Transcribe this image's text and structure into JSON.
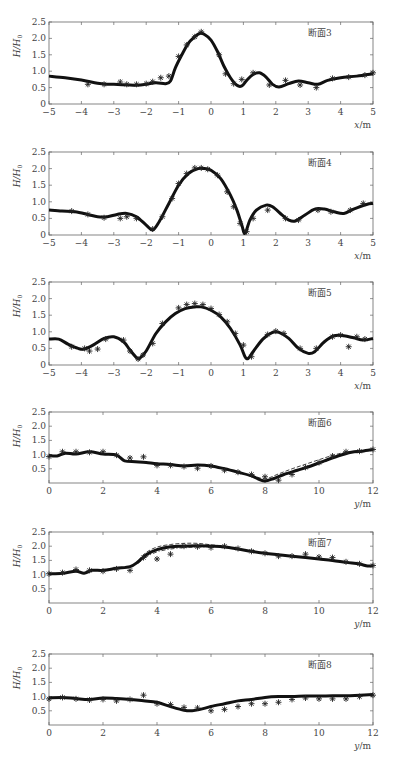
{
  "figure": {
    "ylabel": "H/H0",
    "panels_count": 6
  },
  "chart_data": [
    {
      "type": "line",
      "title": "断面3",
      "xlabel": "x/m",
      "ylabel": "H/H0",
      "xlim": [
        -5,
        5
      ],
      "ylim": [
        0,
        2.5
      ],
      "xticks": [
        -5,
        -4,
        -3,
        -2,
        -1,
        0,
        1,
        2,
        3,
        4,
        5
      ],
      "yticks": [
        0,
        0.5,
        1.0,
        1.5,
        2.0,
        2.5
      ],
      "ytick_labels": [
        "0",
        "0.5",
        "1.0",
        "1.5",
        "2.0",
        "2.5"
      ],
      "grid": false,
      "frame": {
        "top": 22,
        "bottom": 104
      },
      "series": [
        {
          "name": "computed",
          "style": "solid-thick",
          "x": [
            -5,
            -4.5,
            -4,
            -3.5,
            -3.2,
            -3,
            -2.5,
            -2.3,
            -2,
            -1.7,
            -1.4,
            -1.25,
            -1.1,
            -0.9,
            -0.7,
            -0.5,
            -0.35,
            -0.2,
            0,
            0.2,
            0.4,
            0.6,
            0.8,
            0.95,
            1.1,
            1.3,
            1.5,
            1.7,
            1.9,
            2.1,
            2.4,
            2.7,
            3.0,
            3.3,
            3.6,
            4.0,
            4.5,
            5.0
          ],
          "y": [
            0.85,
            0.8,
            0.73,
            0.63,
            0.6,
            0.6,
            0.58,
            0.57,
            0.6,
            0.65,
            0.62,
            0.7,
            1.1,
            1.5,
            1.85,
            2.05,
            2.15,
            2.12,
            1.95,
            1.6,
            1.15,
            0.8,
            0.57,
            0.55,
            0.72,
            0.9,
            0.95,
            0.82,
            0.6,
            0.52,
            0.62,
            0.7,
            0.65,
            0.6,
            0.72,
            0.8,
            0.85,
            0.92
          ]
        },
        {
          "name": "measured",
          "style": "asterisk",
          "x": [
            -3.8,
            -3.3,
            -2.8,
            -2.6,
            -2.3,
            -2.0,
            -1.8,
            -1.55,
            -1.3,
            -1.0,
            -0.75,
            -0.5,
            -0.3,
            0.25,
            0.45,
            0.7,
            0.95,
            1.3,
            1.8,
            2.3,
            2.75,
            3.25,
            3.75,
            4.25,
            4.75,
            5.0
          ],
          "y": [
            0.6,
            0.6,
            0.67,
            0.6,
            0.6,
            0.62,
            0.68,
            0.8,
            0.85,
            1.45,
            1.8,
            2.05,
            2.2,
            1.5,
            0.92,
            0.62,
            0.75,
            0.95,
            0.58,
            0.72,
            0.58,
            0.5,
            0.78,
            0.82,
            0.88,
            0.95
          ]
        }
      ]
    },
    {
      "type": "line",
      "title": "断面4",
      "xlabel": "x/m",
      "ylabel": "H/H0",
      "xlim": [
        -5,
        5
      ],
      "ylim": [
        0,
        2.5
      ],
      "xticks": [
        -5,
        -4,
        -3,
        -2,
        -1,
        0,
        1,
        2,
        3,
        4,
        5
      ],
      "yticks": [
        0,
        0.5,
        1.0,
        1.5,
        2.0,
        2.5
      ],
      "ytick_labels": [
        "0",
        "0.5",
        "1.0",
        "1.5",
        "2.0",
        "2.5"
      ],
      "grid": false,
      "frame": {
        "top": 152,
        "bottom": 235
      },
      "series": [
        {
          "name": "computed",
          "style": "solid-thick",
          "x": [
            -5,
            -4.6,
            -4.2,
            -3.8,
            -3.5,
            -3.2,
            -2.9,
            -2.6,
            -2.3,
            -2.0,
            -1.8,
            -1.6,
            -1.3,
            -1.0,
            -0.7,
            -0.4,
            -0.2,
            0,
            0.3,
            0.6,
            0.8,
            0.95,
            1.05,
            1.2,
            1.4,
            1.7,
            1.9,
            2.2,
            2.4,
            2.6,
            2.9,
            3.2,
            3.5,
            3.8,
            4.1,
            4.4,
            4.8,
            5.0
          ],
          "y": [
            0.75,
            0.72,
            0.7,
            0.62,
            0.55,
            0.55,
            0.62,
            0.65,
            0.55,
            0.3,
            0.15,
            0.4,
            0.95,
            1.5,
            1.85,
            2.0,
            2.0,
            1.95,
            1.7,
            1.2,
            0.75,
            0.3,
            0.05,
            0.45,
            0.75,
            0.9,
            0.85,
            0.6,
            0.45,
            0.42,
            0.6,
            0.78,
            0.78,
            0.7,
            0.65,
            0.78,
            0.92,
            0.95
          ]
        },
        {
          "name": "measured",
          "style": "asterisk",
          "x": [
            -4.3,
            -3.8,
            -3.3,
            -2.8,
            -2.6,
            -2.3,
            -1.8,
            -1.5,
            -1.2,
            -1.0,
            -0.75,
            -0.5,
            -0.3,
            -0.1,
            0.2,
            0.5,
            0.7,
            0.9,
            1.1,
            1.3,
            1.75,
            2.3,
            2.7,
            3.3,
            3.7,
            4.3,
            4.7
          ],
          "y": [
            0.72,
            0.62,
            0.52,
            0.5,
            0.55,
            0.5,
            0.18,
            0.55,
            1.1,
            1.55,
            1.85,
            2.02,
            2.02,
            1.98,
            1.8,
            1.3,
            0.85,
            0.35,
            0.1,
            0.5,
            0.75,
            0.5,
            0.45,
            0.75,
            0.7,
            0.75,
            0.95
          ]
        }
      ]
    },
    {
      "type": "line",
      "title": "断面5",
      "xlabel": "x/m",
      "ylabel": "H/H0",
      "xlim": [
        -5,
        5
      ],
      "ylim": [
        0,
        2.5
      ],
      "xticks": [
        -5,
        -4,
        -3,
        -2,
        -1,
        0,
        1,
        2,
        3,
        4,
        5
      ],
      "yticks": [
        0,
        0.5,
        1.0,
        1.5,
        2.0,
        2.5
      ],
      "ytick_labels": [
        "0",
        "0.5",
        "1.0",
        "1.5",
        "2.0",
        "2.5"
      ],
      "grid": false,
      "frame": {
        "top": 282,
        "bottom": 365
      },
      "series": [
        {
          "name": "computed",
          "style": "solid-thick",
          "x": [
            -5,
            -4.7,
            -4.4,
            -4.1,
            -3.9,
            -3.6,
            -3.3,
            -3.0,
            -2.7,
            -2.5,
            -2.3,
            -2.2,
            -2.0,
            -1.7,
            -1.4,
            -1.1,
            -0.8,
            -0.5,
            -0.3,
            0,
            0.3,
            0.6,
            0.9,
            1.05,
            1.15,
            1.3,
            1.6,
            1.9,
            2.1,
            2.4,
            2.7,
            3.0,
            3.2,
            3.5,
            3.8,
            4.1,
            4.4,
            4.7,
            5.0
          ],
          "y": [
            0.78,
            0.78,
            0.62,
            0.5,
            0.48,
            0.62,
            0.8,
            0.85,
            0.7,
            0.45,
            0.22,
            0.2,
            0.42,
            0.95,
            1.3,
            1.55,
            1.7,
            1.75,
            1.75,
            1.65,
            1.45,
            1.1,
            0.6,
            0.25,
            0.2,
            0.4,
            0.78,
            0.98,
            0.98,
            0.8,
            0.5,
            0.35,
            0.4,
            0.7,
            0.88,
            0.88,
            0.82,
            0.75,
            0.8
          ]
        },
        {
          "name": "measured",
          "style": "asterisk",
          "x": [
            -4.3,
            -3.9,
            -3.75,
            -3.5,
            -3.25,
            -2.7,
            -2.5,
            -2.25,
            -2.1,
            -1.8,
            -1.5,
            -1.0,
            -0.75,
            -0.5,
            -0.25,
            0,
            0.25,
            0.5,
            0.75,
            1.0,
            1.25,
            1.75,
            2.0,
            2.25,
            2.75,
            3.25,
            3.75,
            4.0,
            4.25,
            4.5,
            4.75
          ],
          "y": [
            0.55,
            0.5,
            0.42,
            0.48,
            0.78,
            0.75,
            0.42,
            0.18,
            0.3,
            0.65,
            1.25,
            1.72,
            1.82,
            1.85,
            1.82,
            1.7,
            1.52,
            1.3,
            0.95,
            0.6,
            0.25,
            0.92,
            1.02,
            0.95,
            0.5,
            0.5,
            0.85,
            0.9,
            0.55,
            0.85,
            0.78
          ]
        }
      ]
    },
    {
      "type": "line",
      "title": "断面6",
      "xlabel": "y/m",
      "ylabel": "H/H0",
      "xlim": [
        0,
        12
      ],
      "ylim": [
        0,
        2.5
      ],
      "xticks": [
        0,
        2,
        4,
        6,
        8,
        10,
        12
      ],
      "yticks": [
        0.5,
        1.0,
        1.5,
        2.0,
        2.5
      ],
      "ytick_labels": [
        "0.5",
        "1.0",
        "1.5",
        "2.0",
        "2.5"
      ],
      "grid": false,
      "frame": {
        "top": 412,
        "bottom": 483
      },
      "series": [
        {
          "name": "computed",
          "style": "solid-thick",
          "x": [
            0,
            0.3,
            0.6,
            1.0,
            1.5,
            2.0,
            2.5,
            2.8,
            3.2,
            3.6,
            4.0,
            4.5,
            5.0,
            5.5,
            6.0,
            6.5,
            7.0,
            7.5,
            7.8,
            8.0,
            8.3,
            8.7,
            9.2,
            9.7,
            10.2,
            10.7,
            11.2,
            11.6,
            12.0
          ],
          "y": [
            0.97,
            0.95,
            1.05,
            1.02,
            1.1,
            1.02,
            0.98,
            0.78,
            0.75,
            0.72,
            0.68,
            0.65,
            0.6,
            0.63,
            0.6,
            0.5,
            0.38,
            0.25,
            0.12,
            0.07,
            0.15,
            0.3,
            0.45,
            0.6,
            0.78,
            0.95,
            1.08,
            1.12,
            1.18
          ]
        },
        {
          "name": "computed-dashed",
          "style": "dashed",
          "x": [
            7.5,
            8.0,
            8.5,
            9.0,
            9.5,
            10.0,
            10.5,
            11.0,
            12.0
          ],
          "y": [
            0.28,
            0.15,
            0.32,
            0.5,
            0.66,
            0.82,
            0.97,
            1.08,
            1.18
          ]
        },
        {
          "name": "measured",
          "style": "asterisk",
          "x": [
            0,
            0.5,
            1.0,
            1.5,
            2.0,
            2.5,
            3.0,
            3.5,
            4.0,
            4.5,
            5.0,
            5.5,
            6.0,
            6.5,
            7.0,
            7.5,
            8.0,
            8.5,
            9.0,
            9.5,
            10.0,
            10.5,
            11.0,
            11.5,
            12.0
          ],
          "y": [
            0.93,
            1.1,
            1.1,
            1.08,
            1.1,
            0.98,
            0.88,
            0.92,
            0.62,
            0.62,
            0.58,
            0.52,
            0.6,
            0.45,
            0.38,
            0.3,
            0.22,
            0.1,
            0.3,
            0.55,
            0.72,
            0.95,
            1.1,
            1.12,
            1.18
          ]
        }
      ]
    },
    {
      "type": "line",
      "title": "断面7",
      "xlabel": "y/m",
      "ylabel": "H/H0",
      "xlim": [
        0,
        12
      ],
      "ylim": [
        0,
        2.5
      ],
      "xticks": [
        0,
        2,
        4,
        6,
        8,
        10,
        12
      ],
      "yticks": [
        0.5,
        1.0,
        1.5,
        2.0,
        2.5
      ],
      "ytick_labels": [
        "0.5",
        "1.0",
        "1.5",
        "2.0",
        "2.5"
      ],
      "grid": false,
      "frame": {
        "top": 532,
        "bottom": 603
      },
      "series": [
        {
          "name": "computed",
          "style": "solid-thick",
          "x": [
            0,
            0.5,
            1.0,
            1.3,
            1.6,
            2.0,
            2.5,
            3.0,
            3.3,
            3.6,
            4.0,
            4.5,
            5.0,
            5.5,
            6.0,
            6.5,
            7.0,
            7.5,
            8.0,
            8.5,
            9.0,
            9.5,
            10.0,
            10.5,
            11.0,
            11.5,
            11.8,
            12.0
          ],
          "y": [
            1.03,
            1.05,
            1.12,
            1.05,
            1.15,
            1.15,
            1.22,
            1.28,
            1.45,
            1.7,
            1.88,
            1.98,
            2.0,
            2.02,
            2.0,
            1.97,
            1.9,
            1.82,
            1.75,
            1.7,
            1.65,
            1.6,
            1.55,
            1.5,
            1.43,
            1.37,
            1.3,
            1.32
          ]
        },
        {
          "name": "computed-dashed",
          "style": "dashed",
          "x": [
            3.3,
            3.6,
            4.0,
            4.5,
            5.0,
            5.5,
            6.0,
            6.5
          ],
          "y": [
            1.5,
            1.78,
            1.97,
            2.06,
            2.1,
            2.1,
            2.05,
            2.0
          ]
        },
        {
          "name": "computed-dashdot",
          "style": "dashdot",
          "x": [
            3.3,
            3.6,
            4.0,
            4.5,
            5.0,
            5.5,
            6.0
          ],
          "y": [
            1.4,
            1.62,
            1.8,
            1.9,
            1.95,
            1.97,
            1.98
          ]
        },
        {
          "name": "measured",
          "style": "asterisk",
          "x": [
            0,
            0.5,
            1.0,
            1.5,
            2.0,
            2.5,
            3.0,
            3.5,
            4.0,
            4.5,
            5.0,
            5.5,
            6.0,
            6.5,
            7.0,
            7.5,
            8.0,
            8.5,
            9.0,
            9.5,
            10.0,
            10.5,
            11.0,
            11.5,
            12.0
          ],
          "y": [
            1.03,
            1.07,
            1.18,
            1.15,
            1.12,
            1.2,
            1.15,
            1.6,
            1.55,
            1.72,
            2.0,
            1.98,
            1.95,
            2.0,
            1.92,
            1.82,
            1.75,
            1.65,
            1.65,
            1.72,
            1.62,
            1.6,
            1.45,
            1.38,
            1.32
          ]
        }
      ]
    },
    {
      "type": "line",
      "title": "断面8",
      "xlabel": "y/m",
      "ylabel": "H/H0",
      "xlim": [
        0,
        12
      ],
      "ylim": [
        0,
        2.5
      ],
      "xticks": [
        0,
        2,
        4,
        6,
        8,
        10,
        12
      ],
      "yticks": [
        0.5,
        1.0,
        1.5,
        2.0,
        2.5
      ],
      "ytick_labels": [
        "0.5",
        "1.0",
        "1.5",
        "2.0",
        "2.5"
      ],
      "grid": false,
      "frame": {
        "top": 654,
        "bottom": 725
      },
      "series": [
        {
          "name": "computed",
          "style": "solid-thick",
          "x": [
            0,
            0.5,
            1.0,
            1.5,
            2.0,
            2.5,
            3.0,
            3.5,
            4.0,
            4.5,
            5.0,
            5.3,
            5.6,
            6.0,
            6.5,
            7.0,
            7.5,
            8.0,
            8.5,
            9.0,
            9.5,
            10.0,
            10.5,
            11.0,
            11.5,
            12.0
          ],
          "y": [
            0.95,
            0.97,
            0.93,
            0.9,
            0.95,
            0.93,
            0.9,
            0.85,
            0.8,
            0.65,
            0.52,
            0.5,
            0.55,
            0.65,
            0.75,
            0.85,
            0.9,
            0.97,
            1.0,
            1.0,
            1.02,
            1.02,
            1.03,
            1.03,
            1.05,
            1.07
          ]
        },
        {
          "name": "measured",
          "style": "asterisk",
          "x": [
            0,
            0.5,
            1.0,
            1.5,
            2.0,
            2.5,
            3.0,
            3.5,
            4.0,
            4.5,
            5.0,
            5.5,
            6.0,
            6.5,
            7.0,
            7.5,
            8.0,
            8.5,
            9.0,
            9.5,
            10.0,
            10.5,
            11.0,
            11.5,
            12.0
          ],
          "y": [
            0.92,
            0.97,
            0.92,
            0.88,
            0.9,
            0.85,
            0.9,
            1.05,
            0.75,
            0.72,
            0.62,
            0.6,
            0.5,
            0.55,
            0.65,
            0.75,
            0.75,
            0.8,
            0.9,
            0.95,
            0.92,
            0.92,
            0.92,
            1.0,
            1.05
          ]
        }
      ]
    }
  ]
}
